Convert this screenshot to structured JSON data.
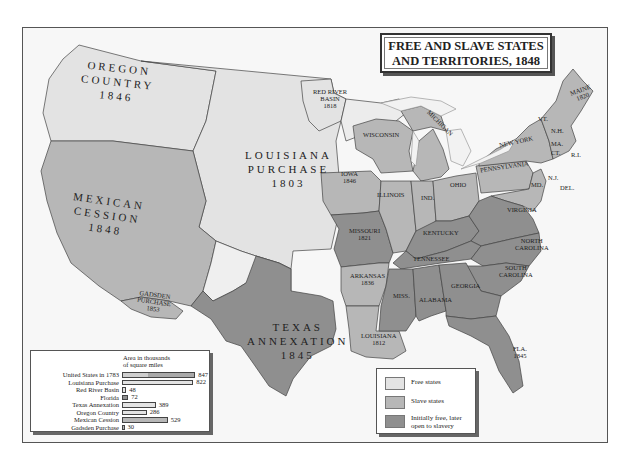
{
  "title": {
    "line1": "FREE AND SLAVE STATES",
    "line2": "AND TERRITORIES, 1848"
  },
  "colors": {
    "free": "#e3e3e3",
    "slave": "#b7b7b7",
    "initially_free_later_slavery": "#8f8f8f",
    "water": "#f7f7f7",
    "border": "#444444"
  },
  "territory_labels": {
    "oregon": {
      "name": "OREGON",
      "name2": "COUNTRY",
      "year": "1846"
    },
    "louisiana_purchase": {
      "name": "LOUISIANA",
      "name2": "PURCHASE",
      "year": "1803"
    },
    "mexican_cession": {
      "name": "MEXICAN",
      "name2": "CESSION",
      "year": "1848"
    },
    "texas": {
      "name": "TEXAS",
      "name2": "ANNEXATION",
      "year": "1845"
    },
    "red_river": {
      "name": "RED RIVER",
      "name2": "BASIN",
      "year": "1818"
    },
    "gadsden": {
      "name": "GADSDEN",
      "name2": "PURCHASE",
      "year": "1853"
    }
  },
  "state_labels": {
    "maine": {
      "name": "MAINE",
      "year": "1820"
    },
    "vt": "VT.",
    "nh": "N.H.",
    "ma": "MA.",
    "ct": "CT.",
    "ri": "R.I.",
    "new_york": "NEW YORK",
    "pennsylvania": "PENNSYLVANIA",
    "nj": "N.J.",
    "del": "DEL.",
    "md": "MD.",
    "virginia": "VIRGINIA",
    "north_carolina": {
      "name": "NORTH",
      "name2": "CAROLINA"
    },
    "south_carolina": {
      "name": "SOUTH",
      "name2": "CAROLINA"
    },
    "georgia": "GEORGIA",
    "alabama": "ALABAMA",
    "miss": "MISS.",
    "tennessee": "TENNESSEE",
    "kentucky": "KENTUCKY",
    "ohio": "OHIO",
    "ind": "IND.",
    "illinois": "ILLINOIS",
    "michigan": "MICHIGAN",
    "wisconsin": "WISCONSIN",
    "iowa": {
      "name": "IOWA",
      "year": "1846"
    },
    "missouri": {
      "name": "MISSOURI",
      "year": "1821"
    },
    "arkansas": {
      "name": "ARKANSAS",
      "year": "1836"
    },
    "louisiana": {
      "name": "LOUISIANA",
      "year": "1812"
    },
    "florida": {
      "name": "FLA.",
      "year": "1845"
    }
  },
  "chart": {
    "heading_line1": "Area in thousands",
    "heading_line2": "of square miles"
  },
  "chart_data": {
    "type": "bar",
    "orientation": "horizontal",
    "title": "Area in thousands of square miles",
    "categories": [
      "United States in 1783",
      "Louisiana Purchase",
      "Red River Basin",
      "Florida",
      "Texas Annexation",
      "Oregon Country",
      "Mexican Cession",
      "Gadsden Purchase"
    ],
    "values": [
      847,
      822,
      48,
      72,
      389,
      286,
      529,
      30
    ],
    "labels": [
      "847",
      "822",
      "48",
      "72",
      "389",
      "286",
      "529",
      "30"
    ],
    "xlabel": "",
    "ylabel": "",
    "xlim": [
      0,
      900
    ],
    "grid": false
  },
  "legend": {
    "items": [
      {
        "label": "Free states",
        "color": "#e3e3e3"
      },
      {
        "label": "Slave states",
        "color": "#b7b7b7"
      },
      {
        "label": "Initially free, later",
        "label2": "open to slavery",
        "color": "#8f8f8f"
      }
    ]
  }
}
